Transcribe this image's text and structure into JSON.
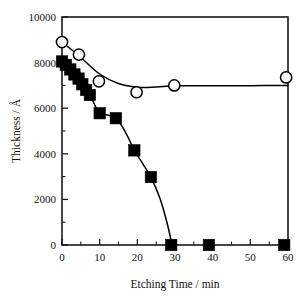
{
  "chart_data": {
    "type": "scatter",
    "title": "",
    "xlabel": "Etching Time / min",
    "ylabel": "Thickness / Å",
    "xlim": [
      0,
      60
    ],
    "ylim": [
      0,
      10000
    ],
    "grid": false,
    "legend_position": "none",
    "x_ticks": [
      0,
      10,
      20,
      30,
      40,
      50,
      60
    ],
    "x_tick_labels": [
      "0",
      "10",
      "20",
      "30",
      "40",
      "50",
      "60"
    ],
    "x_minor_ticks": [
      5,
      15,
      25,
      35,
      45,
      55
    ],
    "y_ticks": [
      0,
      2000,
      4000,
      6000,
      8000,
      10000
    ],
    "y_tick_labels": [
      "0",
      "2000",
      "4000",
      "6000",
      "8000",
      "10000"
    ],
    "y_minor_ticks": [
      1000,
      3000,
      5000,
      7000,
      9000
    ],
    "series": [
      {
        "name": "open-circles",
        "marker": "open-circle",
        "points": [
          {
            "x": 0.0,
            "y": 8900
          },
          {
            "x": 4.5,
            "y": 8350
          },
          {
            "x": 9.8,
            "y": 7180
          },
          {
            "x": 19.8,
            "y": 6700
          },
          {
            "x": 29.8,
            "y": 7000
          },
          {
            "x": 59.5,
            "y": 7350
          }
        ],
        "curve": [
          {
            "x": 0.0,
            "y": 8900
          },
          {
            "x": 4.5,
            "y": 8300
          },
          {
            "x": 10.0,
            "y": 7500
          },
          {
            "x": 15.0,
            "y": 7080
          },
          {
            "x": 20.0,
            "y": 6920
          },
          {
            "x": 25.0,
            "y": 6930
          },
          {
            "x": 30.0,
            "y": 6980
          },
          {
            "x": 40.0,
            "y": 6990
          },
          {
            "x": 50.0,
            "y": 6990
          },
          {
            "x": 60.0,
            "y": 7000
          }
        ]
      },
      {
        "name": "filled-squares",
        "marker": "filled-square",
        "points": [
          {
            "x": 0.0,
            "y": 8050
          },
          {
            "x": 1.0,
            "y": 7900
          },
          {
            "x": 2.2,
            "y": 7700
          },
          {
            "x": 3.3,
            "y": 7480
          },
          {
            "x": 4.4,
            "y": 7300
          },
          {
            "x": 5.4,
            "y": 7050
          },
          {
            "x": 6.4,
            "y": 6800
          },
          {
            "x": 7.4,
            "y": 6580
          },
          {
            "x": 10.0,
            "y": 5780
          },
          {
            "x": 14.3,
            "y": 5560
          },
          {
            "x": 19.2,
            "y": 4150
          },
          {
            "x": 23.6,
            "y": 2980
          },
          {
            "x": 29.0,
            "y": 0
          },
          {
            "x": 39.0,
            "y": 0
          },
          {
            "x": 59.0,
            "y": 0
          }
        ],
        "curve": [
          {
            "x": 0.0,
            "y": 8050
          },
          {
            "x": 3.0,
            "y": 7550
          },
          {
            "x": 6.0,
            "y": 6950
          },
          {
            "x": 8.0,
            "y": 6380
          },
          {
            "x": 10.0,
            "y": 5820
          },
          {
            "x": 14.3,
            "y": 5560
          },
          {
            "x": 17.0,
            "y": 4900
          },
          {
            "x": 19.2,
            "y": 4150
          },
          {
            "x": 21.5,
            "y": 3550
          },
          {
            "x": 23.6,
            "y": 2980
          },
          {
            "x": 26.0,
            "y": 2050
          },
          {
            "x": 28.0,
            "y": 900
          },
          {
            "x": 29.2,
            "y": 0
          }
        ]
      }
    ]
  }
}
